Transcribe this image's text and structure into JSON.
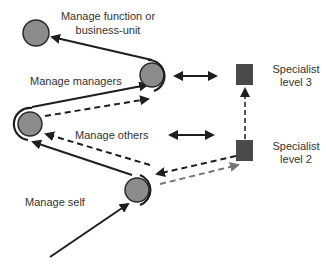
{
  "diagram": {
    "colors": {
      "node_fill": "#8c8c8c",
      "node_stroke": "#2a2a2a",
      "square_fill": "#4a4a4a",
      "line_dark": "#1e1e1e",
      "line_gray": "#777777",
      "text": "#333333"
    },
    "nodes": [
      {
        "id": "manage-self",
        "label": "Manage self",
        "shape": "circle"
      },
      {
        "id": "manage-others",
        "label": "Manage others",
        "shape": "circle"
      },
      {
        "id": "manage-managers",
        "label": "Manage managers",
        "shape": "circle"
      },
      {
        "id": "manage-function",
        "label_line1": "Manage function or",
        "label_line2": "business-unit",
        "shape": "circle"
      },
      {
        "id": "specialist-2",
        "label_line1": "Specialist",
        "label_line2": "level 2",
        "shape": "square"
      },
      {
        "id": "specialist-3",
        "label_line1": "Specialist",
        "label_line2": "level 3",
        "shape": "square"
      }
    ],
    "edges": [
      {
        "from": "entry",
        "to": "manage-self",
        "style": "solid"
      },
      {
        "from": "manage-self",
        "to": "manage-others",
        "style": "solid"
      },
      {
        "from": "manage-others",
        "to": "manage-managers",
        "style": "solid"
      },
      {
        "from": "manage-managers",
        "to": "manage-function",
        "style": "solid"
      },
      {
        "from": "specialist-2",
        "to": "manage-others",
        "style": "dashed"
      },
      {
        "from": "specialist-2",
        "to": "manage-self",
        "style": "dashed"
      },
      {
        "from": "manage-self",
        "to": "specialist-2",
        "style": "dashed-gray"
      },
      {
        "from": "manage-others",
        "to": "manage-managers",
        "style": "dashed"
      },
      {
        "from": "specialist-2",
        "to": "specialist-3",
        "style": "dashed"
      },
      {
        "from": "manage-managers",
        "to": "specialist-3",
        "style": "double-arrow"
      },
      {
        "from": "manage-others-row",
        "to": "specialist-2",
        "style": "double-arrow"
      }
    ]
  }
}
